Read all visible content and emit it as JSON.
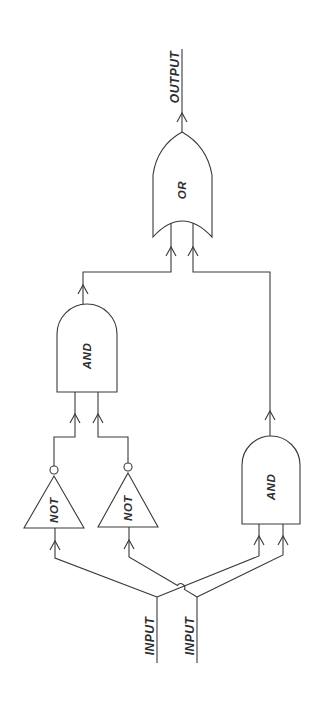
{
  "diagram": {
    "type": "logic-circuit",
    "labels": {
      "output": "OUTPUT",
      "inputs": [
        "INPUT",
        "INPUT"
      ]
    },
    "gates": [
      {
        "id": "or",
        "type": "OR",
        "label": "OR"
      },
      {
        "id": "and_upper",
        "type": "AND",
        "label": "AND"
      },
      {
        "id": "and_lower",
        "type": "AND",
        "label": "AND"
      },
      {
        "id": "not_left",
        "type": "NOT",
        "label": "NOT"
      },
      {
        "id": "not_right",
        "type": "NOT",
        "label": "NOT"
      }
    ],
    "connections": [
      {
        "from": "input_1",
        "to": "not_left"
      },
      {
        "from": "input_1",
        "to": "and_lower"
      },
      {
        "from": "input_2",
        "to": "not_right"
      },
      {
        "from": "input_2",
        "to": "and_lower"
      },
      {
        "from": "not_left",
        "to": "and_upper"
      },
      {
        "from": "not_right",
        "to": "and_upper"
      },
      {
        "from": "and_upper",
        "to": "or"
      },
      {
        "from": "and_lower",
        "to": "or"
      },
      {
        "from": "or",
        "to": "output"
      }
    ],
    "colors": {
      "line": "#3a3a3a",
      "background": "#ffffff"
    }
  }
}
